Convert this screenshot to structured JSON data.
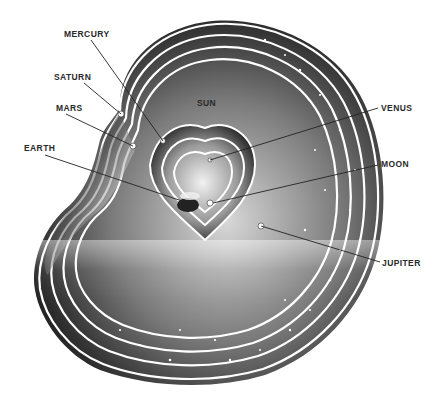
{
  "figure": {
    "labels": [
      {
        "id": "mercury",
        "text": "MERCURY",
        "x": 64,
        "y": 30
      },
      {
        "id": "saturn",
        "text": "SATURN",
        "x": 54,
        "y": 73
      },
      {
        "id": "mars",
        "text": "MARS",
        "x": 56,
        "y": 104
      },
      {
        "id": "earth",
        "text": "EARTH",
        "x": 24,
        "y": 144
      },
      {
        "id": "sun",
        "text": "SUN",
        "x": 197,
        "y": 99
      },
      {
        "id": "venus",
        "text": "VENUS",
        "x": 381,
        "y": 104
      },
      {
        "id": "moon",
        "text": "MOON",
        "x": 381,
        "y": 160
      },
      {
        "id": "jupiter",
        "text": "JUPITER",
        "x": 382,
        "y": 259
      }
    ],
    "colors": {
      "background": "#ffffff",
      "shell_dark": "#1a1a1a",
      "shell_light": "#f4f4f4",
      "divider": "#ffffff",
      "label_text": "#2a2a2a",
      "leader_line": "#222222"
    }
  }
}
